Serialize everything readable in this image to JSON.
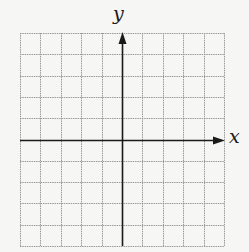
{
  "diagram": {
    "type": "coordinate-plane",
    "x_axis_label": "x",
    "y_axis_label": "y",
    "grid": {
      "columns": 10,
      "rows": 10,
      "left": 20,
      "top": 33,
      "right": 224,
      "bottom": 246,
      "line_color": "#9a9a9a",
      "line_style": "dotted"
    },
    "axes": {
      "x_axis_row": 5,
      "y_axis_col": 5,
      "color": "#1a1a1a",
      "x_arrow": "right",
      "y_arrow": "up"
    },
    "background": "#f6f6f4"
  }
}
